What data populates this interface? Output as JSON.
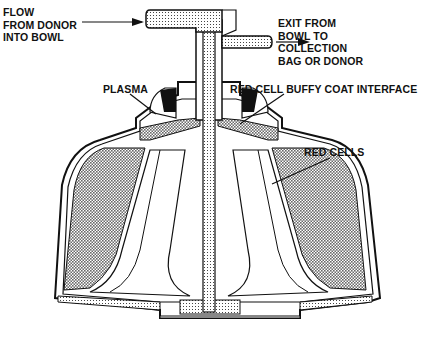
{
  "diagram": {
    "colors": {
      "line": "#111111",
      "hatch": "#7a7a7a",
      "background": "#ffffff"
    },
    "labels": {
      "inflow": "FLOW\nFROM DONOR\nINTO BOWL",
      "outflow": "EXIT FROM\nBOWL TO\nCOLLECTION\nBAG OR DONOR",
      "plasma": "PLASMA",
      "interface": "RED CELL BUFFY COAT INTERFACE",
      "red_cells": "RED CELLS"
    }
  }
}
